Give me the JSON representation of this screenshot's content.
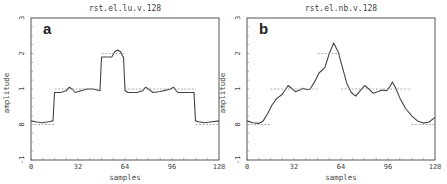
{
  "chart_data": [
    {
      "type": "line",
      "panel_label": "a",
      "title": "rst.el.lu.v.128",
      "xlabel": "samples",
      "ylabel": "amplitude",
      "xlim": [
        0,
        128
      ],
      "ylim": [
        -1,
        3
      ],
      "xticks": [
        0,
        32,
        64,
        96,
        128
      ],
      "yticks": [
        -1,
        0,
        1,
        2,
        3
      ],
      "grid": false,
      "series": [
        {
          "name": "reconstruction",
          "style": "solid",
          "x": [
            0,
            4,
            8,
            12,
            15,
            16,
            20,
            24,
            26,
            28,
            30,
            34,
            38,
            42,
            47,
            48,
            52,
            55,
            57,
            59,
            61,
            62,
            63,
            64,
            66,
            72,
            76,
            78,
            80,
            83,
            88,
            92,
            95,
            97,
            99,
            100,
            106,
            111,
            112,
            114,
            118,
            122,
            128
          ],
          "y": [
            0.1,
            0.07,
            0.05,
            0.08,
            0.1,
            0.9,
            0.9,
            0.95,
            1.05,
            1.0,
            0.9,
            0.95,
            1.0,
            1.0,
            0.95,
            1.9,
            1.9,
            1.9,
            2.05,
            2.1,
            2.05,
            1.95,
            1.9,
            0.95,
            0.9,
            0.9,
            0.95,
            1.05,
            1.0,
            0.9,
            0.93,
            0.97,
            1.0,
            1.05,
            0.95,
            0.9,
            0.9,
            0.9,
            0.1,
            0.08,
            0.05,
            0.07,
            0.1
          ]
        },
        {
          "name": "reference",
          "style": "dashed",
          "segments": [
            {
              "x": [
                0,
                16
              ],
              "y": 0
            },
            {
              "x": [
                16,
                48
              ],
              "y": 1
            },
            {
              "x": [
                48,
                64
              ],
              "y": 2
            },
            {
              "x": [
                64,
                112
              ],
              "y": 1
            },
            {
              "x": [
                112,
                128
              ],
              "y": 0
            }
          ]
        }
      ]
    },
    {
      "type": "line",
      "panel_label": "b",
      "title": "rst.el.nb.v.128",
      "xlabel": "samples",
      "ylabel": "amplitude",
      "xlim": [
        0,
        128
      ],
      "ylim": [
        -1,
        3
      ],
      "xticks": [
        0,
        32,
        64,
        96,
        128
      ],
      "yticks": [
        -1,
        0,
        1,
        2,
        3
      ],
      "grid": false,
      "series": [
        {
          "name": "reconstruction",
          "style": "solid",
          "x": [
            0,
            4,
            8,
            11,
            14,
            17,
            20,
            24,
            28,
            31,
            33,
            36,
            38,
            41,
            43,
            46,
            49,
            53,
            56,
            59,
            62,
            65,
            68,
            71,
            74,
            77,
            80,
            83,
            86,
            89,
            92,
            95,
            97,
            99,
            101,
            104,
            108,
            112,
            116,
            120,
            124,
            128
          ],
          "y": [
            0.1,
            0.05,
            0.03,
            0.1,
            0.3,
            0.55,
            0.72,
            0.85,
            1.1,
            1.0,
            0.92,
            0.97,
            1.02,
            0.98,
            1.0,
            1.2,
            1.45,
            1.6,
            2.0,
            2.3,
            2.05,
            1.6,
            1.15,
            0.9,
            0.8,
            0.95,
            1.1,
            1.0,
            0.88,
            0.92,
            0.97,
            0.95,
            1.05,
            1.2,
            1.05,
            0.75,
            0.45,
            0.25,
            0.1,
            0.04,
            0.07,
            0.2
          ]
        },
        {
          "name": "reference",
          "style": "dashed",
          "segments": [
            {
              "x": [
                0,
                16
              ],
              "y": 0
            },
            {
              "x": [
                16,
                48
              ],
              "y": 1
            },
            {
              "x": [
                48,
                64
              ],
              "y": 2
            },
            {
              "x": [
                64,
                112
              ],
              "y": 1
            },
            {
              "x": [
                112,
                128
              ],
              "y": 0
            }
          ]
        }
      ]
    }
  ]
}
